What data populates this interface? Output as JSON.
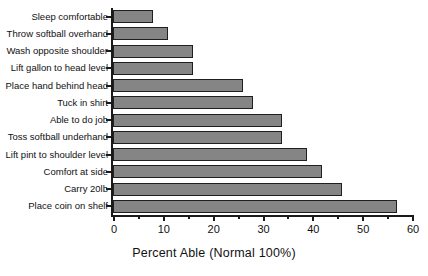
{
  "chart_data": {
    "type": "bar",
    "orientation": "horizontal",
    "title": "",
    "xlabel": "Percent Able (Normal 100%)",
    "ylabel": "",
    "xlim": [
      0,
      60
    ],
    "xticks": [
      0,
      10,
      20,
      30,
      40,
      50,
      60
    ],
    "xtick_labels": [
      "0",
      "10",
      "20",
      "30",
      "40",
      "50",
      "60"
    ],
    "grid": false,
    "legend": null,
    "bar_color": "#858585",
    "bar_edge_color": "#1f1f1f",
    "categories": [
      "Sleep comfortable",
      "Throw softball overhand",
      "Wash opposite shoulder",
      "Lift gallon to head level",
      "Place hand behind head",
      "Tuck in shirt",
      "Able to do job",
      "Toss softball underhand",
      "Lift pint to shoulder level",
      "Comfort at side",
      "Carry 20lb",
      "Place coin on shelf"
    ],
    "values": [
      8,
      11,
      16,
      16,
      26,
      28,
      34,
      34,
      39,
      42,
      46,
      57
    ]
  }
}
